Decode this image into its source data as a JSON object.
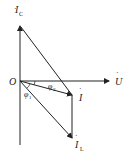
{
  "diagram": {
    "origin_label": "O",
    "vectors": {
      "U": {
        "label": "U",
        "sub": ""
      },
      "IC": {
        "label": "I",
        "sub": "C"
      },
      "I": {
        "label": "I",
        "sub": ""
      },
      "IL": {
        "label": "I",
        "sub": "L"
      }
    },
    "angles": {
      "phi1": {
        "label": "φ",
        "sub": "1"
      },
      "phi2": {
        "label": "φ",
        "sub": "2"
      }
    }
  }
}
